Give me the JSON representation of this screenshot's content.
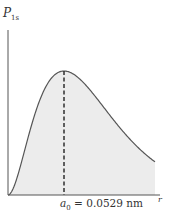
{
  "chart_data": {
    "type": "area",
    "title": "",
    "xlabel": "r",
    "ylabel": "P_1s",
    "ylabel_main": "P",
    "ylabel_sub": "1s",
    "function": "P(r) proportional to r^2 * exp(-2r/a0)",
    "x_units": "a0",
    "x": [
      0,
      0.25,
      0.5,
      0.75,
      1.0,
      1.25,
      1.5,
      2.0,
      2.5,
      3.0,
      3.5,
      4.0,
      4.5,
      5.0
    ],
    "values": [
      0.0,
      0.167,
      0.5,
      0.828,
      1.0,
      0.933,
      0.708,
      0.293,
      0.086,
      0.02,
      0.004,
      0.001,
      0.0,
      0.0
    ],
    "xlim": [
      0,
      5.5
    ],
    "ylim": [
      0,
      1.45
    ],
    "grid": false,
    "legend": null,
    "fill_color": "#ececec",
    "line_color": "#555555",
    "annotations": [
      {
        "type": "dashed_vertical_line",
        "x": 1.0,
        "label_main": "a",
        "label_sub": "0",
        "label_rest": " = 0.0529 nm"
      }
    ]
  }
}
